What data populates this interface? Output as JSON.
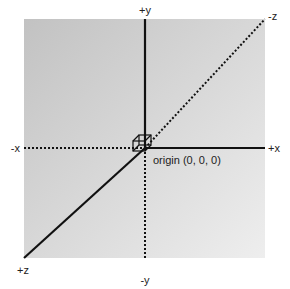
{
  "diagram": {
    "colors": {
      "background": "#ffffff",
      "panel_dark": "#c4c4c4",
      "panel_light": "#ececec",
      "axis": "#111111"
    },
    "axes": {
      "pos_y": "+y",
      "neg_y": "-y",
      "pos_x": "+x",
      "neg_x": "-x",
      "pos_z": "+z",
      "neg_z": "-z"
    },
    "origin_label": "origin (0, 0, 0)",
    "legend_note": "solid = positive direction, dotted = negative direction"
  }
}
